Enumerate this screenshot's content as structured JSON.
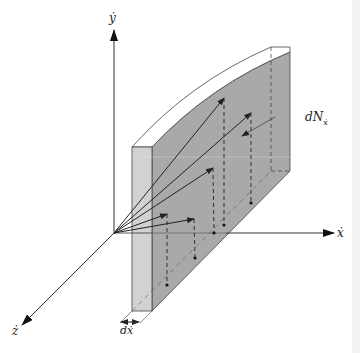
{
  "figure": {
    "labels": {
      "y_axis": "ẏ",
      "x_axis": "ẋ",
      "z_axis": "ż",
      "thickness": "dẋ",
      "number_density": "dN",
      "number_density_sub": "ẋ"
    },
    "colors": {
      "slab_side": "#a9a9a9",
      "slab_front": "#d2d2d2",
      "slab_top": "#ffffff",
      "lines": "#222222"
    },
    "vectors": [
      {
        "tip": [
          224,
          98
        ],
        "foot": [
          224,
          225
        ]
      },
      {
        "tip": [
          251,
          113
        ],
        "foot": [
          251,
          203
        ]
      },
      {
        "tip": [
          213,
          168
        ],
        "foot": [
          214,
          233
        ]
      },
      {
        "tip": [
          194,
          219
        ],
        "foot": [
          195,
          258
        ]
      },
      {
        "tip": [
          167,
          214
        ],
        "foot": [
          167,
          285
        ]
      }
    ]
  }
}
